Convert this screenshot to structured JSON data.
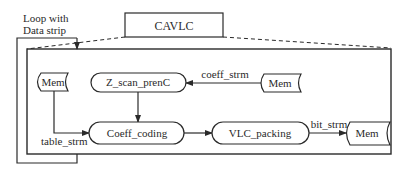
{
  "diagram": {
    "title_box": {
      "label": "CAVLC"
    },
    "loop_label": {
      "line1": "Loop with",
      "line2": "Data strip"
    },
    "nodes": {
      "mem_left": {
        "label": "Mem"
      },
      "z_scan": {
        "label": "Z_scan_prenC"
      },
      "mem_right_top": {
        "label": "Mem"
      },
      "coeff_coding": {
        "label": "Coeff_coding"
      },
      "vlc_packing": {
        "label": "VLC_packing"
      },
      "mem_right_bottom": {
        "label": "Mem"
      }
    },
    "edges": {
      "coeff_strm": {
        "label": "coeff_strm"
      },
      "table_strm": {
        "label": "table_strm"
      },
      "bit_strm": {
        "label": "bit_strm"
      }
    },
    "colors": {
      "stroke": "#2a2a2a",
      "background": "#ffffff"
    }
  }
}
